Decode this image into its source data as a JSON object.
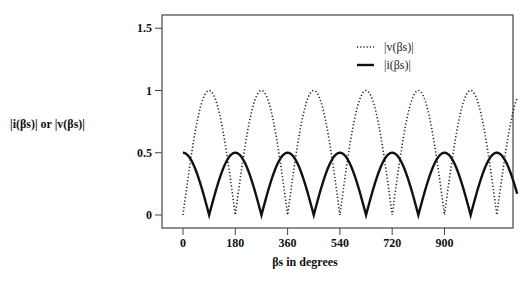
{
  "chart_data": {
    "type": "line",
    "title": "",
    "xlabel": "βs  in degrees",
    "ylabel": "|i(βs)| or |v(βs)|",
    "xlim": [
      -40,
      1260
    ],
    "ylim": [
      -0.1,
      1.6
    ],
    "x_ticks": [
      0,
      180,
      360,
      540,
      720,
      900
    ],
    "y_ticks": [
      0,
      0.5,
      1,
      1.5
    ],
    "y_tick_labels": [
      "0",
      "0.5",
      "1",
      "1.5"
    ],
    "grid": false,
    "legend_position": "upper right",
    "x_range_data": [
      0,
      1150
    ],
    "series": [
      {
        "name": "|v(βs)|",
        "style": "dotted",
        "formula": "|sin(βs)|",
        "x": [
          0,
          90,
          180,
          270,
          360,
          450,
          540,
          630,
          720,
          810,
          900,
          990,
          1080,
          1150
        ],
        "values": [
          0,
          1,
          0,
          1,
          0,
          1,
          0,
          1,
          0,
          1,
          0,
          1,
          0,
          0.94
        ]
      },
      {
        "name": "|i(βs)|",
        "style": "solid",
        "formula": "0.5·|cos(βs)|",
        "x": [
          0,
          90,
          180,
          270,
          360,
          450,
          540,
          630,
          720,
          810,
          900,
          990,
          1080,
          1150
        ],
        "values": [
          0.5,
          0,
          0.5,
          0,
          0.5,
          0,
          0.5,
          0,
          0.5,
          0,
          0.5,
          0,
          0.5,
          0.17
        ]
      }
    ]
  },
  "legend": {
    "items": [
      {
        "label": "|v(βs)|",
        "style": "dotted"
      },
      {
        "label": "|i(βs)|",
        "style": "solid"
      }
    ]
  },
  "axes": {
    "xlabel": "βs  in degrees",
    "ylabel": "|i(βs)| or |v(βs)|"
  },
  "colors": {
    "line": "#111111",
    "frame": "#444444",
    "background": "#ffffff"
  }
}
